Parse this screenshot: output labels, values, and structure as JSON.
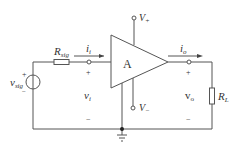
{
  "diagram": {
    "type": "amplifier-circuit",
    "colors": {
      "wire": "#555555",
      "text": "#333333",
      "background": "#ffffff"
    },
    "amplifier": {
      "label": "A",
      "supply_positive": "V",
      "supply_positive_sub": "+",
      "supply_negative": "V",
      "supply_negative_sub": "−"
    },
    "source": {
      "label": "v",
      "label_sub": "sig",
      "plus": "+",
      "minus": "−"
    },
    "source_resistor": {
      "label": "R",
      "label_sub": "sig"
    },
    "input_current": {
      "label": "i",
      "label_sub": "i"
    },
    "input_voltage": {
      "label": "v",
      "label_sub": "i",
      "plus": "+",
      "minus": "−"
    },
    "output_current": {
      "label": "i",
      "label_sub": "o"
    },
    "output_voltage": {
      "label": "v",
      "label_sub": "o",
      "plus": "+",
      "minus": "−"
    },
    "load_resistor": {
      "label": "R",
      "label_sub": "L"
    },
    "ground": {
      "label": ""
    }
  }
}
